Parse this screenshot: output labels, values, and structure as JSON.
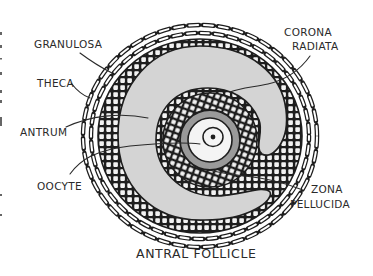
{
  "diagram": {
    "title": "ANTRAL FOLLICLE",
    "labels": {
      "granulosa": "GRANULOSA",
      "theca": "THECA",
      "antrum": "ANTRUM",
      "oocyte": "OOCYTE",
      "corona_radiata_line1": "CORONA",
      "corona_radiata_line2": "RADIATA",
      "zona_pellucida_line1": "ZONA",
      "zona_pellucida_line2": "PELLUCIDA"
    },
    "colors": {
      "ink": "#1e1e1e",
      "antrum_fill": "#d4d4d4",
      "zona_fill": "#9a9a9a",
      "cell_fill": "#f2f2f2",
      "oocyte_fill": "#f4f4f4"
    }
  }
}
